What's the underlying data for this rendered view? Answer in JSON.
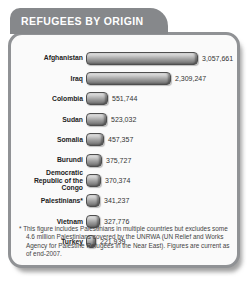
{
  "header": {
    "title": "REFUGEES BY ORIGIN"
  },
  "chart_data": {
    "type": "bar",
    "orientation": "horizontal",
    "title": "REFUGEES BY ORIGIN",
    "categories": [
      "Afghanistan",
      "Iraq",
      "Colombia",
      "Sudan",
      "Somalia",
      "Burundi",
      "Democratic Republic of the Congo",
      "Palestinians*",
      "Vietnam",
      "Turkey"
    ],
    "values": [
      3057661,
      2309247,
      551744,
      523032,
      457357,
      375727,
      370374,
      341237,
      327776,
      221939
    ],
    "value_labels": [
      "3,057,661",
      "2,309,247",
      "551,744",
      "523,032",
      "457,357",
      "375,727",
      "370,374",
      "341,237",
      "327,776",
      "221,939"
    ],
    "xlim": [
      0,
      3057661
    ],
    "max_bar_px": 110,
    "bar_colors": {
      "gradient_top": "#ececec",
      "gradient_bottom": "#6c6c6c",
      "border": "#4e4e4e"
    },
    "legend": null,
    "grid": false
  },
  "footnote": {
    "text": "* This figure includes Palestinians in multiple countries but excludes some 4.6 million Palestinians covered by the UNRWA (UN Relief and Works Agency for Palestine Refugees in the Near East).  Figures are current as of end-2007."
  },
  "colors": {
    "tab_background": "#86888b",
    "panel_border": "#909295",
    "panel_background": "#fafafa",
    "title_text": "#ffffff",
    "label_text": "#222222",
    "value_text": "#333333"
  }
}
